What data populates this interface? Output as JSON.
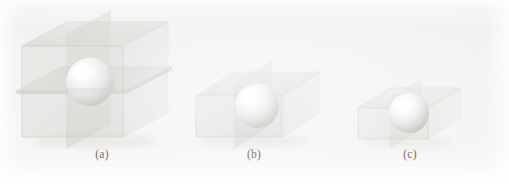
{
  "figure": {
    "width": 509,
    "height": 184,
    "background_color": "#f1f1ef"
  },
  "colors": {
    "paper": "#f1f1ef",
    "box_fill": "#d9d9d6",
    "box_edge": "#b9b9b5",
    "plane_fill": "#c9c9c5",
    "sphere_light": "#ffffff",
    "sphere_mid": "#e6e6e4",
    "sphere_dark": "#b0b0ac",
    "caption_text": "#4a4a4a"
  },
  "panels": [
    {
      "id": "a",
      "caption": "(a)",
      "shape_label": "cube-with-sphere",
      "aspect": "tall",
      "has_cut_planes": true,
      "caption_x": 82,
      "caption_y": 152,
      "caption_width": 40,
      "box": {
        "x": 20,
        "y": 18,
        "width": 150,
        "height": 122
      }
    },
    {
      "id": "b",
      "caption": "(b)",
      "shape_label": "flat-box-with-sphere",
      "aspect": "medium",
      "has_cut_planes": true,
      "caption_x": 243,
      "caption_y": 152,
      "caption_width": 40,
      "box": {
        "x": 192,
        "y": 80,
        "width": 128,
        "height": 62
      }
    },
    {
      "id": "c",
      "caption": "(c)",
      "shape_label": "thin-box-with-sphere",
      "aspect": "short",
      "has_cut_planes": true,
      "caption_x": 400,
      "caption_y": 152,
      "caption_width": 40,
      "box": {
        "x": 358,
        "y": 92,
        "width": 104,
        "height": 52
      }
    }
  ]
}
